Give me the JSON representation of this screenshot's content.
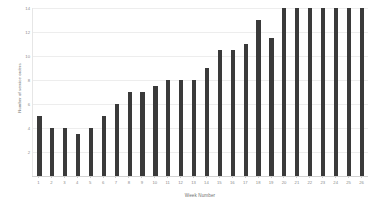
{
  "chart_data": {
    "type": "bar",
    "title": "",
    "subtitle": "",
    "xlabel": "Week Number",
    "ylabel": "Number of service orders",
    "categories": [
      "1",
      "2",
      "3",
      "4",
      "5",
      "6",
      "7",
      "8",
      "9",
      "10",
      "11",
      "12",
      "13",
      "14",
      "15",
      "16",
      "17",
      "18",
      "19",
      "20",
      "21",
      "22",
      "23",
      "24",
      "25",
      "26"
    ],
    "values": [
      5,
      4,
      4,
      3.5,
      4,
      5,
      6,
      7,
      7,
      7.5,
      8,
      8,
      8,
      9,
      10.5,
      10.5,
      11,
      13,
      11.5,
      14,
      14,
      14,
      14,
      14,
      14,
      14
    ],
    "series": [
      {
        "name": "Number of service orders",
        "values": [
          5,
          4,
          4,
          3.5,
          4,
          5,
          6,
          7,
          7,
          7.5,
          8,
          8,
          8,
          9,
          10.5,
          10.5,
          11,
          13,
          11.5,
          14,
          14,
          14,
          14,
          14,
          14,
          14
        ]
      }
    ],
    "ylim": [
      0,
      14
    ],
    "xlim": [
      0.5,
      26.5
    ],
    "y_ticks": [
      "2",
      "4",
      "6",
      "8",
      "10",
      "12",
      "14"
    ],
    "y_tick_values": [
      2,
      4,
      6,
      8,
      10,
      12,
      14
    ],
    "grid": "horizontal",
    "legend": "none",
    "bar_color": "#3a3a3a",
    "grid_color": "#ededed",
    "axis_color": "#d2d2d2",
    "text_color": "#8a8a8a",
    "background": "#ffffff"
  }
}
